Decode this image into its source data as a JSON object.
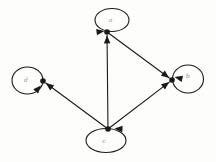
{
  "diagram": {
    "kind": "directed-graph",
    "background": "#fdfdfc",
    "stroke_color": "#1a1a1a",
    "label_color": "#8f8f8f",
    "canvas": {
      "width": 216,
      "height": 162
    },
    "node_radius": 2.8,
    "line_width": 1.1,
    "arrow": {
      "length": 8,
      "width": 6.5
    },
    "nodes": [
      {
        "id": "a",
        "label": "a",
        "x": 107,
        "y": 32,
        "label_x": 110.5,
        "label_y": 20.5,
        "loop": {
          "cx": 112,
          "cy": 20,
          "rx": 17,
          "ry": 11.5
        },
        "loop_arrow": {
          "x": 104.5,
          "y": 31,
          "angle": -8
        }
      },
      {
        "id": "b",
        "label": "b",
        "x": 172,
        "y": 80,
        "label_x": 188,
        "label_y": 76.5,
        "loop": {
          "cx": 188,
          "cy": 79,
          "rx": 15.5,
          "ry": 14
        },
        "loop_arrow": {
          "x": 174.5,
          "y": 77,
          "angle": 193
        }
      },
      {
        "id": "c",
        "label": "c",
        "x": 108,
        "y": 129,
        "label_x": 104,
        "label_y": 141.5,
        "loop": {
          "cx": 106,
          "cy": 140.5,
          "rx": 20,
          "ry": 12
        },
        "loop_arrow": {
          "x": 114.5,
          "y": 128.5,
          "angle": 183
        }
      },
      {
        "id": "d",
        "label": "d",
        "x": 43,
        "y": 81,
        "label_x": 26,
        "label_y": 80.5,
        "loop": {
          "cx": 27.5,
          "cy": 80.5,
          "rx": 15.5,
          "ry": 13.5
        },
        "loop_arrow": {
          "x": 41,
          "y": 85.5,
          "angle": -48
        }
      }
    ],
    "edges": [
      {
        "from": "c",
        "to": "a"
      },
      {
        "from": "a",
        "to": "b"
      },
      {
        "from": "c",
        "to": "b"
      },
      {
        "from": "c",
        "to": "d"
      }
    ]
  }
}
